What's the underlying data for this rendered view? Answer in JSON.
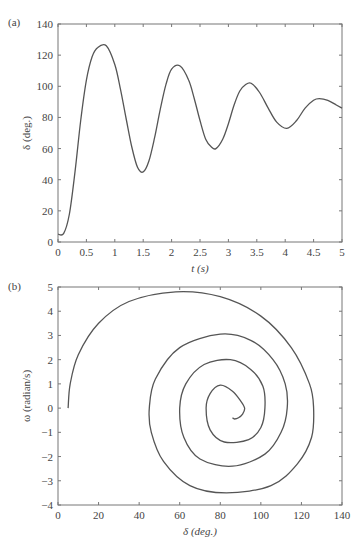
{
  "chart_data": [
    {
      "panel": "(a)",
      "type": "line",
      "title": "",
      "xlabel": "t (s)",
      "ylabel": "δ (deg.)",
      "xlim": [
        0,
        5
      ],
      "ylim": [
        0,
        140
      ],
      "xticks": [
        "0",
        "0.5",
        "1",
        "1.5",
        "2",
        "2.5",
        "3",
        "3.5",
        "4",
        "4.5",
        "5"
      ],
      "yticks": [
        "0",
        "20",
        "40",
        "60",
        "80",
        "100",
        "120",
        "140"
      ],
      "grid": false,
      "series": [
        {
          "name": "δ(t)",
          "x": [
            0,
            0.1,
            0.2,
            0.3,
            0.4,
            0.5,
            0.6,
            0.7,
            0.85,
            1.0,
            1.1,
            1.2,
            1.3,
            1.4,
            1.5,
            1.6,
            1.7,
            1.8,
            1.9,
            2.0,
            2.15,
            2.3,
            2.4,
            2.5,
            2.6,
            2.7,
            2.78,
            2.9,
            3.0,
            3.1,
            3.2,
            3.3,
            3.4,
            3.55,
            3.7,
            3.85,
            4.03,
            4.2,
            4.35,
            4.5,
            4.6,
            4.75,
            4.9,
            5.0
          ],
          "y": [
            5,
            5.5,
            18,
            45,
            78,
            104,
            119,
            125,
            126,
            114,
            98,
            79,
            61,
            48,
            45,
            52,
            67,
            85,
            101,
            111,
            113,
            104,
            92,
            78,
            66,
            61,
            60,
            66,
            76,
            88,
            97,
            101,
            102,
            96,
            86,
            77,
            73,
            78,
            86,
            91,
            92,
            91,
            88,
            86
          ]
        }
      ]
    },
    {
      "panel": "(b)",
      "type": "line",
      "title": "",
      "xlabel": "δ (deg.)",
      "ylabel": "ω (radian/s)",
      "xlim": [
        0,
        140
      ],
      "ylim": [
        -4,
        5
      ],
      "xticks": [
        "0",
        "20",
        "40",
        "60",
        "80",
        "100",
        "120",
        "140"
      ],
      "yticks": [
        "−4",
        "−3",
        "−2",
        "−1",
        "0",
        "1",
        "2",
        "3",
        "4",
        "5"
      ],
      "grid": false,
      "series": [
        {
          "name": "phase trajectory",
          "x": [
            5,
            6,
            10,
            20,
            35,
            58,
            80,
            100,
            115,
            124,
            126,
            125,
            118,
            105,
            83,
            65,
            52,
            46,
            45,
            48,
            60,
            80,
            95,
            106,
            112,
            113,
            110,
            102,
            86,
            70,
            62,
            60,
            63,
            72,
            85,
            95,
            101,
            102,
            100,
            94,
            82,
            75,
            73,
            75,
            80,
            86,
            90,
            92,
            91,
            89,
            87,
            86
          ],
          "y": [
            0,
            1,
            2.2,
            3.5,
            4.4,
            4.8,
            4.6,
            3.8,
            2.5,
            1.0,
            0,
            -1.2,
            -2.3,
            -3.2,
            -3.5,
            -3.2,
            -2.2,
            -1.0,
            0,
            1.2,
            2.5,
            3.05,
            2.8,
            2.0,
            1.0,
            0,
            -1.0,
            -1.9,
            -2.4,
            -2.1,
            -1.2,
            0,
            1.0,
            1.8,
            2.0,
            1.6,
            0.9,
            0,
            -0.8,
            -1.3,
            -1.4,
            -0.9,
            0,
            0.6,
            0.95,
            0.7,
            0.3,
            0,
            -0.25,
            -0.4,
            -0.45,
            -0.4
          ]
        }
      ]
    }
  ],
  "panels": {
    "a": {
      "label": "(a)",
      "xlabel": "t (s)",
      "ylabel": "δ (deg.)"
    },
    "b": {
      "label": "(b)",
      "xlabel": "δ (deg.)",
      "ylabel": "ω (radian/s)"
    }
  }
}
